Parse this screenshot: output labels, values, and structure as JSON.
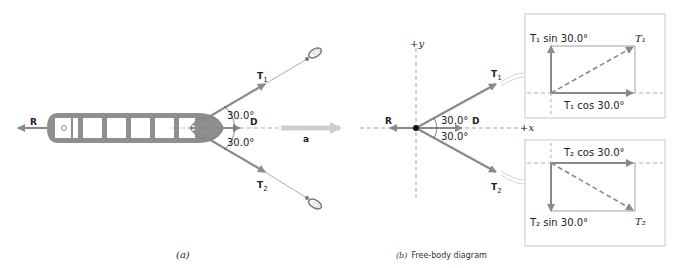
{
  "colors": {
    "arrow": "#8a8a8a",
    "ship_fill": "#8f8f8f",
    "ship_hold": "#ffffff",
    "accel_arrow": "#cfcfcf",
    "dashed": "#8a8a8a",
    "box_border": "#d0d0d0",
    "text": "#222222"
  },
  "panel_a": {
    "caption": "(a)",
    "labels": {
      "R": "R",
      "T1": "T",
      "T1_sub": "1",
      "T2": "T",
      "T2_sub": "2",
      "D": "D",
      "a": "a",
      "angle_top": "30.0°",
      "angle_bottom": "30.0°"
    }
  },
  "panel_b": {
    "caption_prefix": "(b)",
    "caption": "Free-body diagram",
    "axis_y": "+y",
    "axis_x": "+x",
    "labels": {
      "R": "R",
      "D": "D",
      "T1": "T",
      "T1_sub": "1",
      "T2": "T",
      "T2_sub": "2",
      "angle_top": "30.0°",
      "angle_bottom": "30.0°"
    },
    "inset_top": {
      "vertical": "T₁ sin 30.0°",
      "horizontal": "T₁ cos 30.0°",
      "resultant": "T₁"
    },
    "inset_bottom": {
      "vertical": "T₂ sin 30.0°",
      "horizontal": "T₂ cos 30.0°",
      "resultant": "T₂"
    }
  }
}
